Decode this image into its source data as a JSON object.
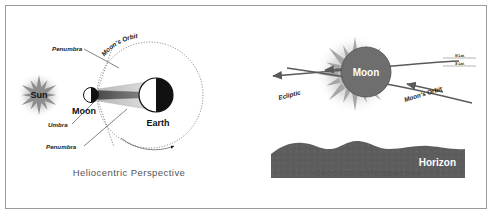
{
  "figure": {
    "border_color": "#9a9a9a",
    "background": "#ffffff"
  },
  "panels": [
    {
      "id": "heliocentric",
      "caption": "Heliocentric Perspective",
      "bodies": [
        {
          "name": "Sun",
          "label": "Sun",
          "style": "spiky-star-gray"
        },
        {
          "name": "Moon",
          "label": "Moon",
          "style": "half-lit-disc"
        },
        {
          "name": "Earth",
          "label": "Earth",
          "style": "half-lit-disc"
        }
      ],
      "annotations": [
        {
          "name": "penumbra-upper",
          "text": "Penumbra"
        },
        {
          "name": "umbra",
          "text": "Umbra"
        },
        {
          "name": "penumbra-lower",
          "text": "Penumbra"
        },
        {
          "name": "moons-orbit",
          "text": "Moon's Orbit"
        }
      ],
      "colors": {
        "sun": "#9a9a9a",
        "umbra": "#6d6d6d",
        "penumbra": "#c9c9c9",
        "body_dark": "#000000",
        "body_light": "#ffffff",
        "orbit": "#555555"
      }
    },
    {
      "id": "geocentric",
      "caption": "Geocentric Perspective",
      "bodies": [
        {
          "name": "Moon",
          "label": "Moon",
          "style": "dark-disc-on-corona"
        }
      ],
      "annotations": [
        {
          "name": "ecliptic",
          "text": "Ecliptic"
        },
        {
          "name": "moons-orbit",
          "text": "Moon's Orbit"
        },
        {
          "name": "north-lat",
          "text": "N Lat."
        },
        {
          "name": "south-lat",
          "text": "S Lat."
        },
        {
          "name": "horizon",
          "text": "Horizon"
        }
      ],
      "colors": {
        "corona": "#b5b5b5",
        "moon_disc": "#6e6e6e",
        "moon_text": "#ffffff",
        "horizon": "#5a5a5a",
        "horizon_text": "#ffffff",
        "line": "#555555"
      }
    }
  ]
}
